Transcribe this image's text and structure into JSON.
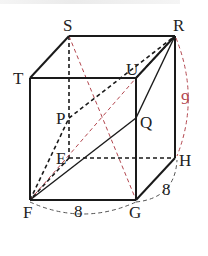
{
  "figure": {
    "type": "cube",
    "vertices": {
      "S": {
        "label": "S",
        "x": 69,
        "y": 36
      },
      "R": {
        "label": "R",
        "x": 175,
        "y": 36
      },
      "T": {
        "label": "T",
        "x": 30,
        "y": 78
      },
      "U": {
        "label": "U",
        "x": 136,
        "y": 78
      },
      "P": {
        "label": "P",
        "x": 69,
        "y": 118
      },
      "Q": {
        "label": "Q",
        "x": 136,
        "y": 118
      },
      "E": {
        "label": "E",
        "x": 69,
        "y": 158
      },
      "H": {
        "label": "H",
        "x": 175,
        "y": 158
      },
      "F": {
        "label": "F",
        "x": 30,
        "y": 200
      },
      "G": {
        "label": "G",
        "x": 136,
        "y": 200
      }
    },
    "dimensions": {
      "FG": "8",
      "GH": "8",
      "RH": "9"
    },
    "colors": {
      "edge": "#1a1a1a",
      "red_dashed": "#b3474f",
      "arc_gray": "#555555"
    }
  }
}
